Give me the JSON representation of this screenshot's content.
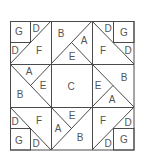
{
  "diagram": {
    "type": "quilt-block-pattern",
    "line_color": "#4a4a4a",
    "label_color": "#555555",
    "background": "#ffffff",
    "grid": "3x3",
    "pieces": {
      "top_left": {
        "labels": [
          "G",
          "D",
          "D",
          "F"
        ]
      },
      "top_middle": {
        "labels": [
          "B",
          "A",
          "E"
        ]
      },
      "top_right": {
        "labels": [
          "D",
          "G",
          "F",
          "D"
        ]
      },
      "middle_left": {
        "labels": [
          "A",
          "E",
          "B"
        ]
      },
      "center": {
        "labels": [
          "C"
        ]
      },
      "middle_right": {
        "labels": [
          "E",
          "B",
          "A"
        ]
      },
      "bottom_left": {
        "labels": [
          "D",
          "F",
          "G",
          "D"
        ]
      },
      "bottom_middle": {
        "labels": [
          "A",
          "E",
          "B"
        ]
      },
      "bottom_right": {
        "labels": [
          "F",
          "D",
          "D",
          "G"
        ]
      }
    }
  }
}
